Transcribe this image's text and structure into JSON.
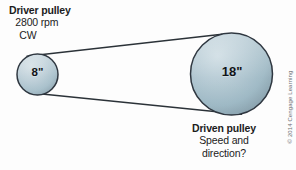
{
  "canvas": {
    "width": 296,
    "height": 170,
    "background": "#fdfdfd"
  },
  "diagram": {
    "type": "belt-pulley-drive",
    "colors": {
      "pulley_fill_light": "#c3d3db",
      "pulley_fill_mid": "#a9c0ca",
      "pulley_fill_dark": "#8fa9b4",
      "pulley_stroke": "#2f3740",
      "belt_stroke": "#2b3238",
      "text": "#1c1c1c",
      "copyright_text": "#6c6f73"
    },
    "driver_pulley": {
      "name": "driver-pulley",
      "cx": 37.5,
      "cy": 74.5,
      "r": 20.5,
      "size_label": "8\"",
      "title": "Driver pulley",
      "speed": "2800 rpm",
      "direction": "CW"
    },
    "driven_pulley": {
      "name": "driven-pulley",
      "cx": 231.5,
      "cy": 74,
      "r": 41,
      "size_label": "18\"",
      "title": "Driven pulley",
      "question_line_1": "Speed and",
      "question_line_2": "direction?"
    },
    "belt": {
      "name": "drive-belt",
      "stroke_width": 1.4,
      "description": "Open belt spanning both pulleys via outer tangent lines"
    }
  },
  "copyright": {
    "text": "© 2014 Cengage Learning"
  }
}
